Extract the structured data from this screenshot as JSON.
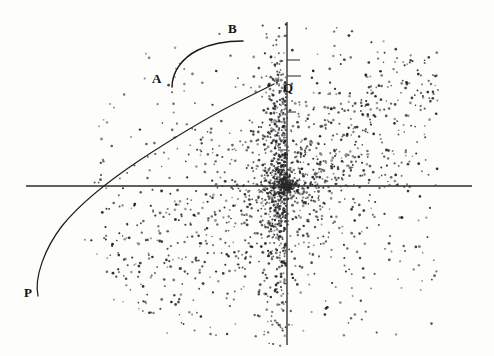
{
  "figure": {
    "width": 494,
    "height": 356,
    "background_color": "#fdfdfc",
    "ink_color": "#262626"
  },
  "labels": {
    "a": "A",
    "b": "B",
    "p": "P",
    "q": "Q"
  },
  "chart_data": {
    "type": "scatter",
    "title": "",
    "subtitle": "",
    "xlabel": "",
    "ylabel": "",
    "grid": false,
    "legend": null,
    "axes": {
      "origin_px": [
        287,
        186
      ],
      "x_axis_px": {
        "y": 186,
        "x_start": 26,
        "x_end": 472
      },
      "y_axis_px": {
        "x": 287,
        "y_start": 22,
        "y_end": 345
      },
      "tick_marks_px": [
        {
          "axis": "y",
          "y": 60,
          "x_from": 287,
          "x_to": 300
        },
        {
          "axis": "y",
          "y": 76,
          "x_from": 287,
          "x_to": 301
        },
        {
          "axis": "y",
          "y": 112,
          "x_from": 287,
          "x_to": 296
        },
        {
          "axis": "y",
          "y": 150,
          "x_from": 278,
          "x_to": 287
        }
      ]
    },
    "annotations": [
      {
        "label": "A",
        "x_px": 158,
        "y_px": 80,
        "role": "arc-start-label"
      },
      {
        "label": "B",
        "x_px": 234,
        "y_px": 30,
        "role": "arc-end-label"
      },
      {
        "label": "P",
        "x_px": 30,
        "y_px": 294,
        "role": "curve-start-label"
      },
      {
        "label": "Q",
        "x_px": 289,
        "y_px": 89,
        "role": "curve-end-label"
      }
    ],
    "curves": [
      {
        "name": "PQ-curve",
        "from_label": "P",
        "to_label": "Q",
        "path_px": "M 38 296 C 34 277 45 248 62 226 C 82 201 110 180 140 160 C 175 137 215 113 248 97 C 260 91 268 87 274 84",
        "x_axis_crossing_px": [
          160,
          186
        ]
      },
      {
        "name": "AB-arc",
        "from_label": "A",
        "to_label": "B",
        "path_px": "M 172 87 C 172 72 182 58 198 50 C 212 43 230 41 243 41"
      }
    ],
    "scatter": {
      "n_points": 2600,
      "description": "comet / fan shaped cloud, densest in a narrow vertical band just left of the vertical axis, spreading left-downward and right",
      "x_range_px": [
        40,
        430
      ],
      "y_range_px": [
        28,
        345
      ],
      "dense_band_x_px": [
        268,
        292
      ],
      "point_size_px": 1.1,
      "point_color": "#262626"
    }
  }
}
